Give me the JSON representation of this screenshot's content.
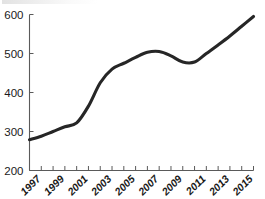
{
  "chart_data": {
    "type": "line",
    "title": "",
    "subtitle": "",
    "xlabel": "",
    "ylabel": "",
    "xlim": [
      1996,
      2015
    ],
    "ylim": [
      200,
      600
    ],
    "grid": false,
    "legend": false,
    "legend_position": "none",
    "line_color": "#262626",
    "axis_color": "#5a5a5a",
    "y_ticks": [
      200,
      300,
      400,
      500,
      600
    ],
    "y_tick_labels": [
      "200",
      "300",
      "400",
      "500",
      "600"
    ],
    "x_ticks": [
      1996,
      1997,
      1998,
      1999,
      2000,
      2001,
      2002,
      2003,
      2004,
      2005,
      2006,
      2007,
      2008,
      2009,
      2010,
      2011,
      2012,
      2013,
      2014,
      2015
    ],
    "x_tick_labels": [
      "1997",
      "1999",
      "2001",
      "2003",
      "2005",
      "2007",
      "2009",
      "2011",
      "2013",
      "2015"
    ],
    "x_label_years": [
      1997,
      1999,
      2001,
      2003,
      2005,
      2007,
      2009,
      2011,
      2013,
      2015
    ],
    "x": [
      1996,
      1997,
      1998,
      1999,
      2000,
      2001,
      2002,
      2003,
      2004,
      2005,
      2006,
      2007,
      2008,
      2009,
      2010,
      2011,
      2012,
      2013,
      2014,
      2015
    ],
    "values": [
      279,
      288,
      300,
      312,
      322,
      365,
      425,
      460,
      475,
      490,
      503,
      505,
      494,
      478,
      478,
      500,
      522,
      545,
      570,
      595
    ],
    "series": [
      {
        "name": "series-1",
        "values": [
          279,
          288,
          300,
          312,
          322,
          365,
          425,
          460,
          475,
          490,
          503,
          505,
          494,
          478,
          478,
          500,
          522,
          545,
          570,
          595
        ]
      }
    ]
  }
}
